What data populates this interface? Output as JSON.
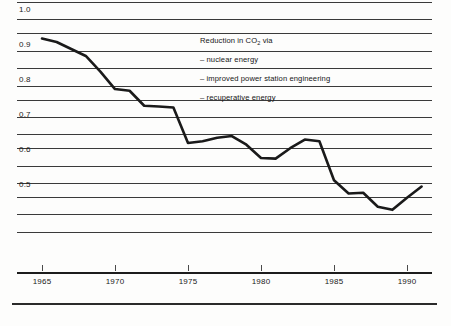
{
  "chart_data": {
    "type": "line",
    "title": "",
    "xlabel": "",
    "ylabel": "",
    "xlim": [
      1965,
      1991
    ],
    "ylim": [
      0.38,
      1.04
    ],
    "grid": true,
    "gridline_values": [
      1.04,
      0.99,
      0.95,
      0.9,
      0.85,
      0.8,
      0.76,
      0.71,
      0.66,
      0.62,
      0.57,
      0.52,
      0.48,
      0.43,
      0.38
    ],
    "y_ticks": [
      "1.0",
      "0.9",
      "0.8",
      "0.7",
      "0.6",
      "0.5"
    ],
    "y_tick_values": [
      1.0,
      0.9,
      0.8,
      0.7,
      0.6,
      0.5
    ],
    "x_ticks": [
      "1965",
      "1970",
      "1975",
      "1980",
      "1985",
      "1990"
    ],
    "x_tick_values": [
      1965,
      1970,
      1975,
      1980,
      1985,
      1990
    ],
    "legend_position": "inside-top-right",
    "annotations": [
      "Reduction in CO2 via",
      "– nuclear energy",
      "– improved power station engineering",
      "– recuperative energy"
    ],
    "series": [
      {
        "name": "Reduction in CO2 via nuclear energy, improved power station engineering, recuperative energy",
        "color": "#1a1a1a",
        "x": [
          1965,
          1966,
          1967,
          1968,
          1969,
          1970,
          1971,
          1972,
          1973,
          1974,
          1975,
          1976,
          1977,
          1978,
          1979,
          1980,
          1981,
          1982,
          1983,
          1984,
          1985,
          1986,
          1987,
          1988,
          1989,
          1990,
          1991
        ],
        "values": [
          0.935,
          0.925,
          0.905,
          0.885,
          0.84,
          0.79,
          0.785,
          0.742,
          0.74,
          0.737,
          0.635,
          0.64,
          0.65,
          0.655,
          0.63,
          0.592,
          0.59,
          0.62,
          0.645,
          0.64,
          0.528,
          0.49,
          0.492,
          0.452,
          0.443,
          0.478,
          0.51
        ]
      }
    ]
  },
  "axes": {
    "y_labels": [
      {
        "text": "1.0",
        "value": 1.0
      },
      {
        "text": "0.9",
        "value": 0.9
      },
      {
        "text": "0.8",
        "value": 0.8
      },
      {
        "text": "0.7",
        "value": 0.7
      },
      {
        "text": "0.6",
        "value": 0.6
      },
      {
        "text": "0.5",
        "value": 0.5
      }
    ],
    "x_labels": [
      {
        "text": "1965",
        "value": 1965
      },
      {
        "text": "1970",
        "value": 1970
      },
      {
        "text": "1975",
        "value": 1975
      },
      {
        "text": "1980",
        "value": 1980
      },
      {
        "text": "1985",
        "value": 1985
      },
      {
        "text": "1990",
        "value": 1990
      }
    ]
  },
  "legend": {
    "heading_prefix": "Reduction in CO",
    "heading_sub": "2",
    "heading_suffix": " via",
    "items": [
      "– nuclear energy",
      "– improved power station engineering",
      "– recuperative energy"
    ]
  },
  "colors": {
    "series": "#1a1a1a",
    "gridline": "#3a3a3a",
    "axis": "#1c1c1c",
    "text": "#1a1a1a",
    "background": "#fdfdfc"
  }
}
